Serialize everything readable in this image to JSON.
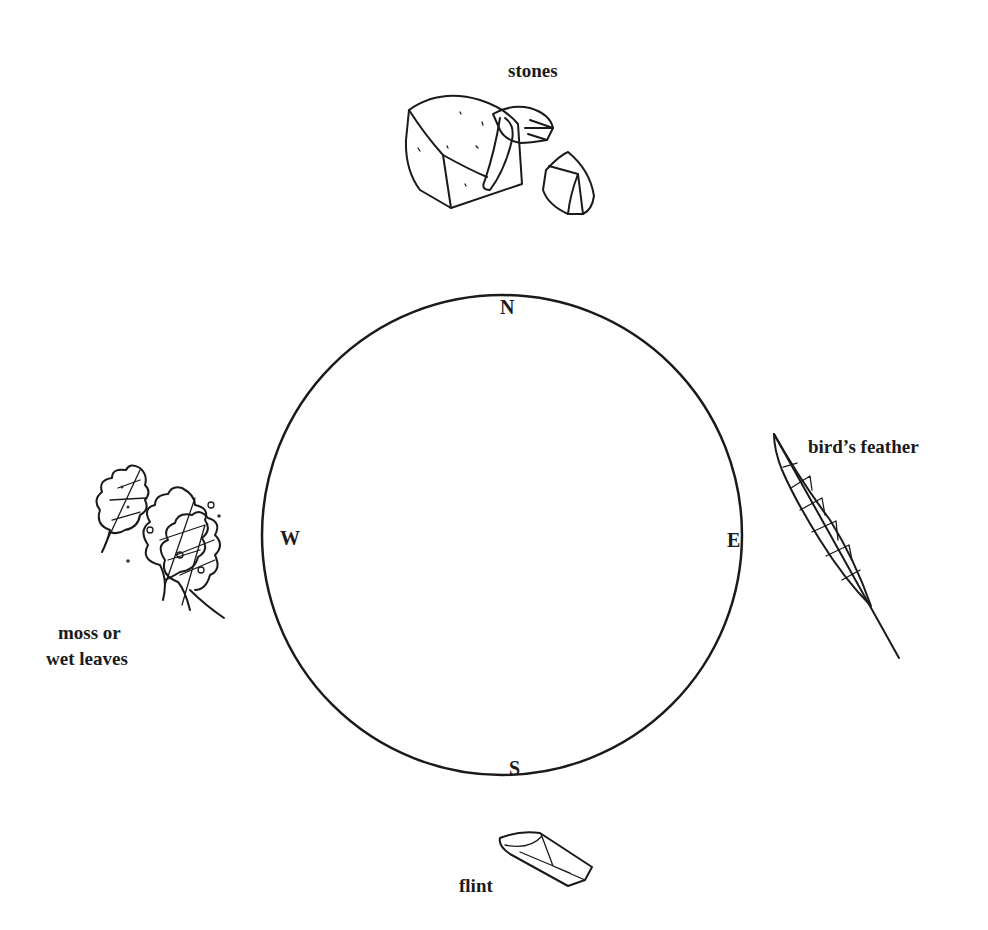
{
  "compass": {
    "north": "N",
    "south": "S",
    "east": "E",
    "west": "W"
  },
  "objects": {
    "north": {
      "label": "stones",
      "icon": "stones-icon"
    },
    "east": {
      "label": "bird’s feather",
      "icon": "feather-icon"
    },
    "south": {
      "label": "flint",
      "icon": "flint-icon"
    },
    "west": {
      "label_line1": "moss or",
      "label_line2": "wet leaves",
      "icon": "leaves-icon"
    }
  },
  "colors": {
    "line": "#1a1a1a",
    "background": "#ffffff"
  }
}
